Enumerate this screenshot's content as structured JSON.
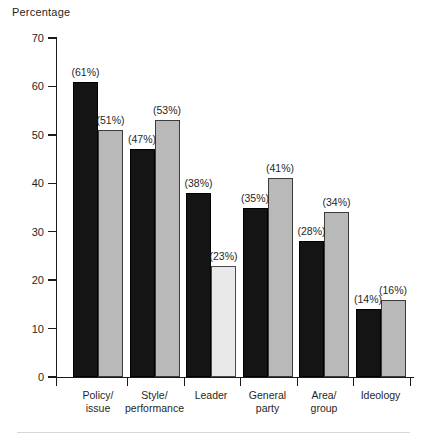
{
  "chart_data": {
    "type": "bar",
    "title": "",
    "subtitle": "",
    "xlabel": "",
    "ylabel": "Percentage",
    "ylim": [
      0,
      70
    ],
    "ytick_labels": [
      "0",
      "10",
      "20",
      "30",
      "40",
      "50",
      "60",
      "70"
    ],
    "ytick_values": [
      0,
      10,
      20,
      30,
      40,
      50,
      60,
      70
    ],
    "grid": false,
    "legend": "none",
    "categories": [
      "Policy/\nissue",
      "Style/\nperformance",
      "Leader",
      "General\nparty",
      "Area/\ngroup",
      "Ideology"
    ],
    "series": [
      {
        "name": "series-1",
        "color": "#141414",
        "values": [
          61,
          47,
          38,
          35,
          28,
          14
        ],
        "labels": [
          "(61%)",
          "(47%)",
          "(38%)",
          "(35%)",
          "(28%)",
          "(14%)"
        ]
      },
      {
        "name": "series-2",
        "color": "#b9b9b9",
        "values": [
          51,
          53,
          23,
          41,
          34,
          16
        ],
        "labels": [
          "(51%)",
          "(53%)",
          "(23%)",
          "(41%)",
          "(34%)",
          "(16%)"
        ]
      }
    ],
    "bar_styles": {
      "series_1": [
        "dark",
        "dark",
        "dark",
        "dark",
        "dark",
        "dark"
      ],
      "series_2": [
        "light",
        "light",
        "pale",
        "light",
        "light",
        "light"
      ]
    },
    "colors": {
      "dark_bar": "#141414",
      "light_bar": "#b9b9b9",
      "pale_bar": "#e9e9e9",
      "axis": "#1a1a1a",
      "text": "#1f1f1f",
      "background": "#ffffff",
      "footer_rule": "#d6d6d6"
    }
  }
}
